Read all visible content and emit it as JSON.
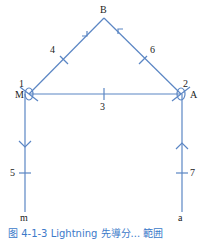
{
  "diagram": {
    "line_color": "#5b86c4",
    "nodes": {
      "top": "B",
      "left_node_label": "M",
      "left_node_number": "1",
      "right_node_label": "A",
      "right_node_number": "2",
      "bottom_left": "m",
      "bottom_right": "a"
    },
    "segments": {
      "horizontal": "3",
      "left_diagonal": "4",
      "right_diagonal": "6",
      "left_vertical": "5",
      "right_vertical": "7"
    },
    "caption": "图 4-1-3  Lightning 先導分... 範囲"
  }
}
